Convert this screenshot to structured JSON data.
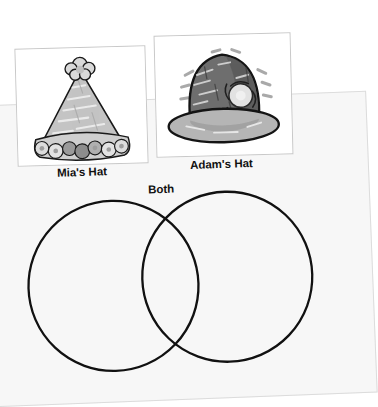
{
  "page": {
    "background_color": "#f7f7f7",
    "outer_background_color": "#ffffff",
    "border_color": "#dcdcdc"
  },
  "photos": [
    {
      "id": "mia-hat-photo",
      "icon": "party-hat-image",
      "alt": "Light gray cone party hat with pom-pom on top and flower trim at the base",
      "caption": "Mia's Hat",
      "colors": {
        "hat_body": "#c4c4c4",
        "outline": "#1a1a1a",
        "pom_pom": "#d9d9d9",
        "trim_light": "#d4d4d4",
        "trim_dark": "#8d8d8d"
      }
    },
    {
      "id": "adam-hat-photo",
      "icon": "bowler-hat-image",
      "alt": "Dark gray bowler hat with a lighter brim and a light flower on the side",
      "caption": "Adam's Hat",
      "colors": {
        "hat_body": "#6e6e6e",
        "hat_shadow": "#4f4f4f",
        "brim": "#b5b5b5",
        "outline": "#1a1a1a",
        "flower": "#e2e2e2"
      }
    }
  ],
  "captions": {
    "mia": "Mia's Hat",
    "adam": "Adam's Hat",
    "both": "Both"
  },
  "venn": {
    "stroke_color": "#111111",
    "stroke_width": 2.3,
    "fill": "none",
    "left_circle": {
      "label": "Mia's Hat",
      "cx": 113,
      "cy": 106,
      "r": 85
    },
    "right_circle": {
      "label": "Adam's Hat",
      "cx": 227,
      "cy": 100,
      "r": 85
    },
    "overlap_label": "Both"
  }
}
